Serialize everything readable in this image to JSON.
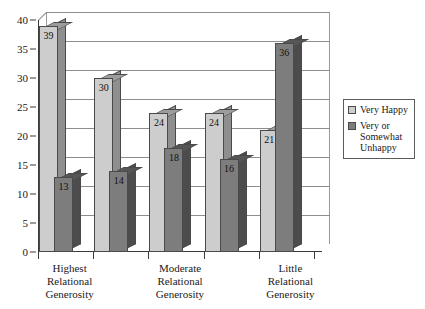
{
  "chart_data": {
    "type": "bar",
    "title": "",
    "subtitle": "",
    "xlabel": "",
    "ylabel": "",
    "ylim": [
      0,
      40
    ],
    "ytick_step": 5,
    "yticks": [
      "0",
      "5",
      "10",
      "15",
      "20",
      "25",
      "30",
      "35",
      "40"
    ],
    "grid": true,
    "legend_position": "right",
    "style": "3d-column",
    "categories": [
      "Highest Relational Generosity",
      "",
      "Moderate Relational Generosity",
      "",
      "Little Relational Generosity"
    ],
    "category_lines": [
      [
        "Highest",
        "Relational",
        "Generosity"
      ],
      [
        "Moderate",
        "Relational",
        "Generosity"
      ],
      [
        "Little",
        "Relational",
        "Generosity"
      ]
    ],
    "series": [
      {
        "name": "Very Happy",
        "color": "#cdcdcd",
        "values": [
          39,
          30,
          24,
          24,
          21
        ]
      },
      {
        "name": "Very or Somewhat Unhappy",
        "color": "#7d7d7d",
        "values": [
          13,
          14,
          18,
          16,
          36
        ]
      }
    ]
  },
  "legend": {
    "entries": [
      {
        "label": "Very Happy",
        "color": "#cdcdcd"
      },
      {
        "label": "Very or Somewhat Unhappy",
        "color": "#7d7d7d"
      }
    ]
  },
  "colors": {
    "light_bar_face": "#cdcdcd",
    "light_bar_side": "#8f8f8f",
    "dark_bar_face": "#7d7d7d",
    "dark_bar_side": "#4c4c4c",
    "axis": "#3a3a3a",
    "gridline": "#8d8d8d",
    "background": "#ffffff"
  }
}
